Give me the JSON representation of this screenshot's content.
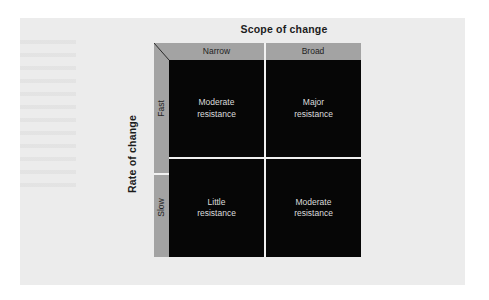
{
  "figure": {
    "title": "Scope of change",
    "y_axis_title": "Rate of change",
    "columns": [
      {
        "label": "Narrow"
      },
      {
        "label": "Broad"
      }
    ],
    "rows": [
      {
        "label": "Fast"
      },
      {
        "label": "Slow"
      }
    ],
    "cells": [
      {
        "line1": "Moderate",
        "line2": "resistance"
      },
      {
        "line1": "Major",
        "line2": "resistance"
      },
      {
        "line1": "Little",
        "line2": "resistance"
      },
      {
        "line1": "Moderate",
        "line2": "resistance"
      }
    ]
  },
  "colors": {
    "page": "#ececec",
    "band": "#a3a3a3",
    "plot": "#060606",
    "divider": "#f0f0f0",
    "title_text": "#1c1c1c",
    "cell_text": "#dcdcdc"
  }
}
